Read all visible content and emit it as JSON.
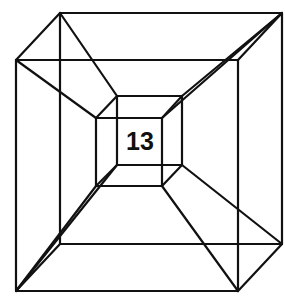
{
  "figure": {
    "label": "13",
    "stroke_color": "#111111",
    "background": "#ffffff",
    "squares": {
      "outer_back": {
        "x1": 60,
        "y1": 13,
        "x2": 282,
        "y2": 244
      },
      "outer_front": {
        "x1": 16,
        "y1": 60,
        "x2": 238,
        "y2": 291
      },
      "inner_back": {
        "x1": 117,
        "y1": 96,
        "x2": 182,
        "y2": 165
      },
      "inner_front": {
        "x1": 96,
        "y1": 118,
        "x2": 162,
        "y2": 186
      }
    },
    "connectors": [
      [
        60,
        13,
        16,
        60
      ],
      [
        282,
        13,
        238,
        60
      ],
      [
        282,
        244,
        238,
        291
      ],
      [
        60,
        244,
        16,
        291
      ],
      [
        117,
        96,
        96,
        118
      ],
      [
        182,
        96,
        162,
        118
      ],
      [
        182,
        165,
        162,
        186
      ],
      [
        117,
        165,
        96,
        186
      ],
      [
        60,
        13,
        117,
        96
      ],
      [
        16,
        60,
        96,
        118
      ],
      [
        282,
        13,
        182,
        96
      ],
      [
        282,
        13,
        162,
        118
      ],
      [
        282,
        244,
        182,
        165
      ],
      [
        238,
        291,
        162,
        186
      ],
      [
        16,
        291,
        117,
        165
      ],
      [
        16,
        291,
        96,
        186
      ]
    ]
  }
}
